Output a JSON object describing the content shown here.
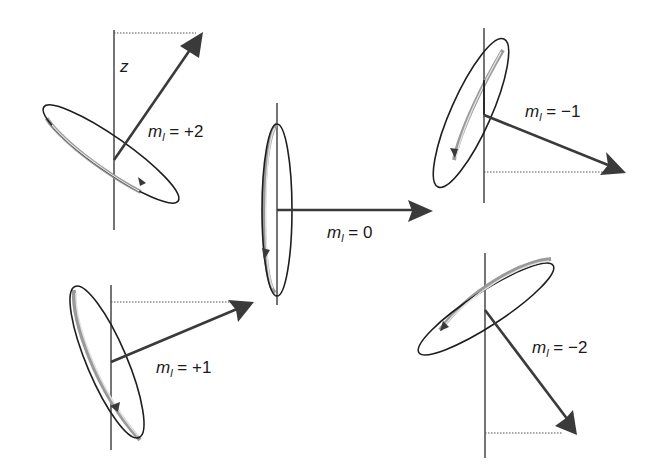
{
  "diagram": {
    "type": "orbital-angular-momentum-orientations",
    "axis_label": "z",
    "colors": {
      "line": "#2a2a2a",
      "vector": "#3a3a3a",
      "band": "#9a9a9a",
      "background": "#ffffff"
    },
    "panels": [
      {
        "id": "ml-plus-2",
        "label_var": "m",
        "label_sub": "l",
        "label_rest": " = +2",
        "axis": {
          "x": 114,
          "y1": 30,
          "y2": 230
        },
        "origin": [
          114,
          160
        ],
        "tip": [
          203,
          32
        ],
        "dotted_y": 33
      },
      {
        "id": "ml-0",
        "label_var": "m",
        "label_sub": "l",
        "label_rest": " = 0",
        "axis": {
          "x": 277,
          "y1": 103,
          "y2": 305
        },
        "origin": [
          277,
          210
        ],
        "tip": [
          433,
          211
        ]
      },
      {
        "id": "ml-minus-1",
        "label_var": "m",
        "label_sub": "l",
        "label_rest": " = −1",
        "axis": {
          "x": 484,
          "y1": 28,
          "y2": 203
        },
        "origin": [
          484,
          115
        ],
        "tip": [
          626,
          173
        ],
        "dotted_y": 172
      },
      {
        "id": "ml-plus-1",
        "label_var": "m",
        "label_sub": "l",
        "label_rest": " = +1",
        "axis": {
          "x": 111,
          "y1": 285,
          "y2": 450
        },
        "origin": [
          111,
          362
        ],
        "tip": [
          254,
          302
        ],
        "dotted_y": 302
      },
      {
        "id": "ml-minus-2",
        "label_var": "m",
        "label_sub": "l",
        "label_rest": " = −2",
        "axis": {
          "x": 485,
          "y1": 253,
          "y2": 458
        },
        "origin": [
          485,
          310
        ],
        "tip": [
          577,
          435
        ],
        "dotted_y": 433
      }
    ]
  }
}
